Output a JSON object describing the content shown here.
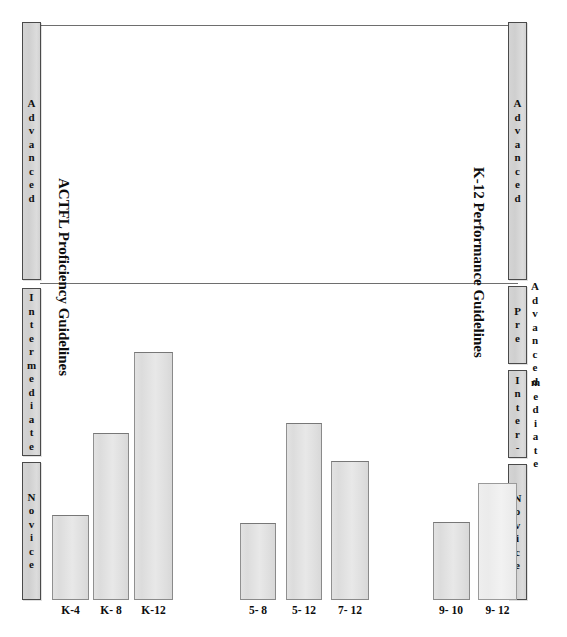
{
  "figure": {
    "left_axis_title": "ACTFL Proficiency Guidelines",
    "right_axis_title": "K-12 Performance Guidelines"
  },
  "left_scale": {
    "bands": [
      {
        "name": "advanced",
        "label": "Advanced"
      },
      {
        "name": "intermediate",
        "label": "Intermediate"
      },
      {
        "name": "novice",
        "label": "Novice"
      }
    ]
  },
  "right_scale": {
    "bands": [
      {
        "name": "advanced",
        "label": "Advanced",
        "outside_label": ""
      },
      {
        "name": "pre-advanced",
        "label": "Pre",
        "outside_label": "Advanced"
      },
      {
        "name": "intermediate",
        "label": "Inter-",
        "outside_label": "mediate"
      },
      {
        "name": "novice",
        "label": "Novice",
        "outside_label": ""
      }
    ]
  },
  "chart_data": {
    "type": "bar",
    "title": "",
    "xlabel": "",
    "ylabel": "Proficiency / Performance level",
    "categories": [
      "K-4",
      "K- 8",
      "K-12",
      "5- 8",
      "5- 12",
      "7- 12",
      "9- 10",
      "9- 12"
    ],
    "values": [
      1.0,
      2.1,
      2.8,
      1.0,
      2.4,
      1.75,
      1.0,
      1.35
    ],
    "ylim": [
      0,
      6
    ],
    "grid": false,
    "legend": null,
    "groups": [
      {
        "name": "elementary-start",
        "categories": [
          "K-4",
          "K- 8",
          "K-12"
        ]
      },
      {
        "name": "middle-start",
        "categories": [
          "5- 8",
          "5- 12",
          "7- 12"
        ]
      },
      {
        "name": "high-start",
        "categories": [
          "9- 10",
          "9- 12"
        ]
      }
    ],
    "y_band_labels_left": [
      "Novice",
      "Intermediate",
      "Advanced"
    ],
    "y_band_labels_right": [
      "Novice",
      "Inter-mediate",
      "Pre-Advanced",
      "Advanced"
    ],
    "annotations": []
  },
  "colors": {
    "bar_fill": "#e2e2e2",
    "bar_fill_pale": "#efefef",
    "bar_border": "#8a8a8a",
    "band_fill": "#d4d4d4",
    "band_border": "#4a4a4a",
    "rule": "#6e6e6e",
    "text": "#0d0d0d",
    "background": "#ffffff"
  }
}
